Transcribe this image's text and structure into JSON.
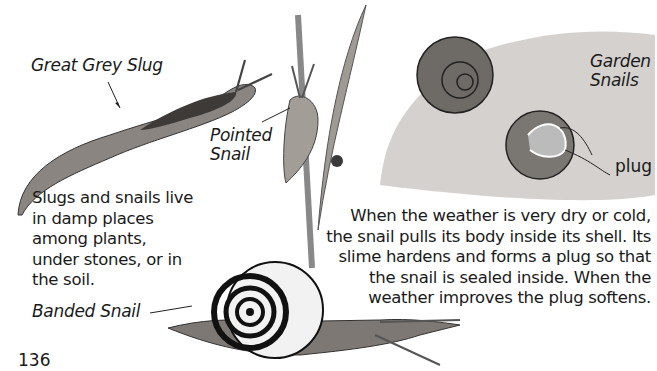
{
  "page": {
    "number": "136",
    "labels": {
      "great_grey_slug": "Great Grey Slug",
      "pointed_snail_line1": "Pointed",
      "pointed_snail_line2": "Snail",
      "garden_snails_line1": "Garden",
      "garden_snails_line2": "Snails",
      "plug": "plug",
      "banded_snail": "Banded Snail"
    },
    "paragraphs": {
      "habitat": [
        "Slugs and snails live",
        "in damp places",
        "among plants,",
        "under stones, or in",
        "the soil."
      ],
      "hibernation": [
        "When the weather is very dry or cold,",
        "the snail pulls its body inside its shell. Its",
        "slime hardens and forms a plug so that",
        "the snail is sealed inside. When the",
        "weather improves the plug softens."
      ]
    },
    "illustrations": [
      "great-grey-slug",
      "pointed-snail-on-grass",
      "ladybird",
      "garden-snails-on-stone",
      "banded-snail"
    ]
  }
}
